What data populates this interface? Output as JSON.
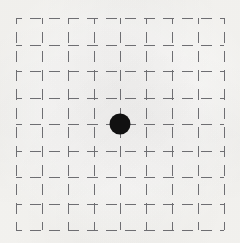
{
  "figure": {
    "title": "",
    "background_color": "#f6f5f2",
    "width": 240,
    "height": 243
  },
  "chart_data": {
    "type": "scatter",
    "title": "",
    "subtitle": "",
    "xlabel": "",
    "ylabel": "",
    "xlim": [
      0,
      8
    ],
    "ylim": [
      0,
      8
    ],
    "xticks": [
      0,
      1,
      2,
      3,
      4,
      5,
      6,
      7,
      8
    ],
    "yticks": [
      0,
      1,
      2,
      3,
      4,
      5,
      6,
      7,
      8
    ],
    "xticklabels": [
      "",
      "",
      "",
      "",
      "",
      "",
      "",
      "",
      ""
    ],
    "yticklabels": [
      "",
      "",
      "",
      "",
      "",
      "",
      "",
      "",
      ""
    ],
    "grid": true,
    "grid_style": "dashed",
    "grid_color": "#6e6e72",
    "grid_linewidth": 1.5,
    "grid_dash": [
      11,
      8
    ],
    "grid_columns": 8,
    "grid_rows": 8,
    "legend": false,
    "legend_position": "none",
    "series": [
      {
        "name": "point",
        "marker": "circle",
        "marker_color": "#111111",
        "marker_size": 21,
        "x": [
          4
        ],
        "y": [
          4
        ]
      }
    ],
    "annotations": []
  },
  "grid_geometry": {
    "left": 16,
    "top": 18,
    "right": 224,
    "bottom": 230,
    "cell_width": 26,
    "cell_height": 26.5
  },
  "point": {
    "label": "grid-point",
    "center_x_px": 118,
    "center_y_px": 123,
    "diameter_px": 21,
    "color": "#111111",
    "grid_col": 4,
    "grid_row": 4
  }
}
